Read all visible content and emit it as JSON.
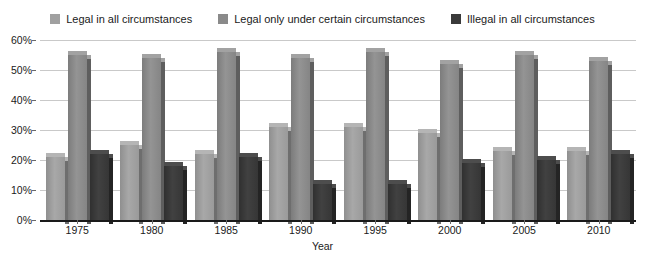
{
  "legend": {
    "items": [
      {
        "label": "Legal in all circumstances",
        "color": "#a0a0a0",
        "icon": "legend-swatch-icon"
      },
      {
        "label": "Legal only under certain circumstances",
        "color": "#8a8a8a",
        "icon": "legend-swatch-icon"
      },
      {
        "label": "Illegal in all circumstances",
        "color": "#3a3a3a",
        "icon": "legend-swatch-icon"
      }
    ]
  },
  "axes": {
    "y_ticks": [
      "0%",
      "10%",
      "20%",
      "30%",
      "40%",
      "50%",
      "60%"
    ],
    "x_title": "Year"
  },
  "chart_data": {
    "type": "bar",
    "title": "",
    "subtitle": "",
    "xlabel": "Year",
    "ylabel": "",
    "ylim": [
      0,
      60
    ],
    "ytick_values": [
      0,
      10,
      20,
      30,
      40,
      50,
      60
    ],
    "ytick_labels": [
      "0%",
      "10%",
      "20%",
      "30%",
      "40%",
      "50%",
      "60%"
    ],
    "grid": true,
    "legend_position": "top-center",
    "categories": [
      "1975",
      "1980",
      "1985",
      "1990",
      "1995",
      "2000",
      "2005",
      "2010"
    ],
    "series": [
      {
        "name": "Legal in all circumstances",
        "color": "#a0a0a0",
        "values": [
          21,
          25,
          22,
          31,
          31,
          29,
          23,
          23
        ]
      },
      {
        "name": "Legal only under certain circumstances",
        "color": "#8a8a8a",
        "values": [
          55,
          54,
          56,
          54,
          56,
          52,
          55,
          53
        ]
      },
      {
        "name": "Illegal in all circumstances",
        "color": "#3a3a3a",
        "values": [
          22,
          18,
          21,
          12,
          12,
          19,
          20,
          22
        ]
      }
    ]
  }
}
